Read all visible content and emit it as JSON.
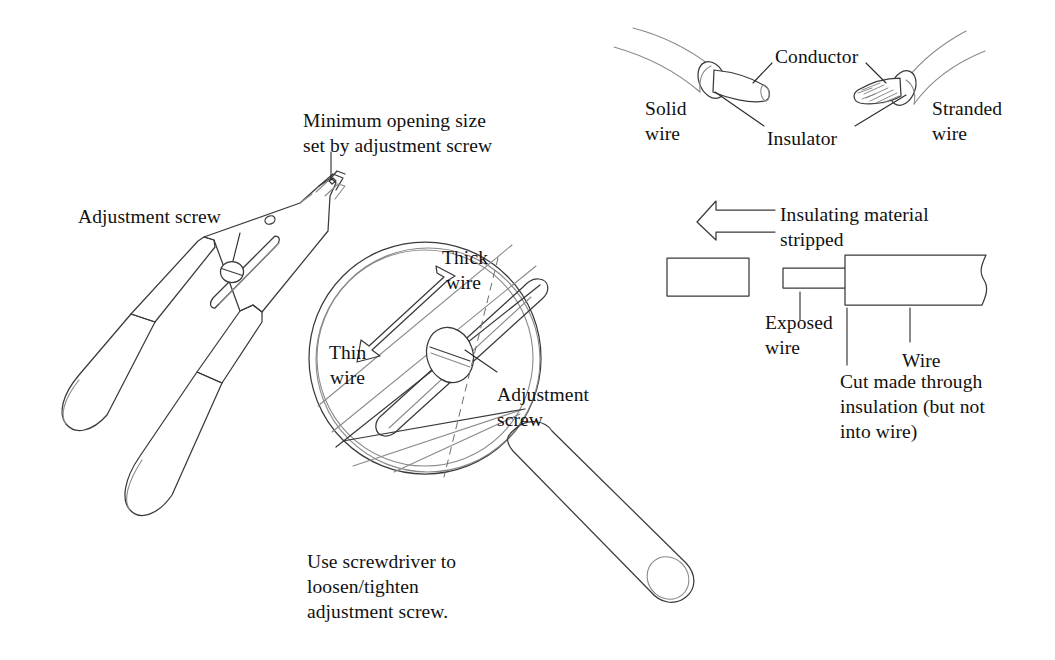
{
  "figure": {
    "background_color": "#ffffff",
    "line_color": "#3a3a3a",
    "light_line_color": "#8a8a8a",
    "text_color": "#111111"
  },
  "tool_panel": {
    "adjustment_screw_label": "Adjustment screw",
    "minimum_opening_label_line1": "Minimum opening size",
    "minimum_opening_label_line2": "set by adjustment screw"
  },
  "magnifier_panel": {
    "thick_wire_label_line1": "Thick",
    "thick_wire_label_line2": "wire",
    "thin_wire_label_line1": "Thin",
    "thin_wire_label_line2": "wire",
    "adjustment_screw_label_line1": "Adjustment",
    "adjustment_screw_label_line2": "screw",
    "caption_line1": "Use screwdriver to",
    "caption_line2": "loosen/tighten",
    "caption_line3": "adjustment screw."
  },
  "wire_types_panel": {
    "conductor_label": "Conductor",
    "insulator_label": "Insulator",
    "solid_wire_label_line1": "Solid",
    "solid_wire_label_line2": "wire",
    "stranded_wire_label_line1": "Stranded",
    "stranded_wire_label_line2": "wire"
  },
  "stripping_panel": {
    "insulating_material_line1": "Insulating material",
    "insulating_material_line2": "stripped",
    "exposed_wire_line1": "Exposed",
    "exposed_wire_line2": "wire",
    "wire_label": "Wire",
    "cut_note_line1": "Cut made through",
    "cut_note_line2": "insulation (but not",
    "cut_note_line3": "into wire)"
  }
}
